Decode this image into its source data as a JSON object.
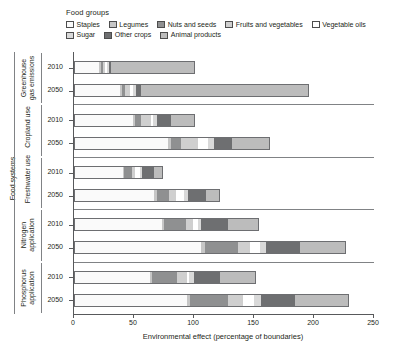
{
  "legend": {
    "title": "Food groups",
    "rows": [
      [
        {
          "label": "Staples",
          "color": "#fafafa",
          "key": "staples"
        },
        {
          "label": "Legumes",
          "color": "#c6c6c6",
          "key": "legumes"
        },
        {
          "label": "Nuts and seeds",
          "color": "#8f9091",
          "key": "nuts_and_seeds"
        },
        {
          "label": "Fruits and vegetables",
          "color": "#cfcfcf",
          "key": "fruits_and_vegetables"
        },
        {
          "label": "Vegetable oils",
          "color": "#ffffff",
          "key": "vegetable_oils"
        }
      ],
      [
        {
          "label": "Sugar",
          "color": "#d9d9d9",
          "key": "sugar"
        },
        {
          "label": "Other crops",
          "color": "#6e6f71",
          "key": "other_crops"
        },
        {
          "label": "Animal products",
          "color": "#bcbcbc",
          "key": "animal_products"
        }
      ]
    ]
  },
  "axis_outer_label": "Food systems",
  "chart_data": {
    "type": "bar",
    "orientation": "horizontal",
    "stacked": true,
    "title": "",
    "xlabel": "Environmental effect (percentage of boundaries)",
    "ylabel": "Food systems",
    "xlim": [
      0,
      250
    ],
    "xticks": [
      0,
      50,
      100,
      150,
      200,
      250
    ],
    "grid": false,
    "legend_position": "top",
    "series": [
      {
        "name": "Staples",
        "color": "#fafafa"
      },
      {
        "name": "Legumes",
        "color": "#c6c6c6"
      },
      {
        "name": "Nuts and seeds",
        "color": "#8f9091"
      },
      {
        "name": "Fruits and vegetables",
        "color": "#cfcfcf"
      },
      {
        "name": "Vegetable oils",
        "color": "#ffffff"
      },
      {
        "name": "Sugar",
        "color": "#d9d9d9"
      },
      {
        "name": "Other crops",
        "color": "#6e6f71"
      },
      {
        "name": "Animal products",
        "color": "#bcbcbc"
      }
    ],
    "groups": [
      {
        "name": "Greenhouse gas emissions",
        "bars": [
          {
            "category": "2010",
            "total": 101,
            "segments": [
              {
                "series": "Staples",
                "value": 21
              },
              {
                "series": "Legumes",
                "value": 1.5
              },
              {
                "series": "Nuts and seeds",
                "value": 1.5
              },
              {
                "series": "Fruits and vegetables",
                "value": 2
              },
              {
                "series": "Vegetable oils",
                "value": 1.5
              },
              {
                "series": "Sugar",
                "value": 1.5
              },
              {
                "series": "Other crops",
                "value": 2
              },
              {
                "series": "Animal products",
                "value": 70
              }
            ]
          },
          {
            "category": "2050",
            "total": 196,
            "segments": [
              {
                "series": "Staples",
                "value": 38
              },
              {
                "series": "Legumes",
                "value": 2
              },
              {
                "series": "Nuts and seeds",
                "value": 2.5
              },
              {
                "series": "Fruits and vegetables",
                "value": 4
              },
              {
                "series": "Vegetable oils",
                "value": 3
              },
              {
                "series": "Sugar",
                "value": 2.5
              },
              {
                "series": "Other crops",
                "value": 4
              },
              {
                "series": "Animal products",
                "value": 140
              }
            ]
          }
        ]
      },
      {
        "name": "Cropland use",
        "bars": [
          {
            "category": "2010",
            "total": 101,
            "segments": [
              {
                "series": "Staples",
                "value": 49
              },
              {
                "series": "Legumes",
                "value": 2
              },
              {
                "series": "Nuts and seeds",
                "value": 5
              },
              {
                "series": "Fruits and vegetables",
                "value": 8
              },
              {
                "series": "Vegetable oils",
                "value": 1.5
              },
              {
                "series": "Sugar",
                "value": 4
              },
              {
                "series": "Other crops",
                "value": 11
              },
              {
                "series": "Animal products",
                "value": 20.5
              }
            ]
          },
          {
            "category": "2050",
            "total": 163,
            "segments": [
              {
                "series": "Staples",
                "value": 78
              },
              {
                "series": "Legumes",
                "value": 3
              },
              {
                "series": "Nuts and seeds",
                "value": 8
              },
              {
                "series": "Fruits and vegetables",
                "value": 14
              },
              {
                "series": "Vegetable oils",
                "value": 9
              },
              {
                "series": "Sugar",
                "value": 5
              },
              {
                "series": "Other crops",
                "value": 15
              },
              {
                "series": "Animal products",
                "value": 31
              }
            ]
          }
        ]
      },
      {
        "name": "Freshwater use",
        "bars": [
          {
            "category": "2010",
            "total": 74,
            "segments": [
              {
                "series": "Staples",
                "value": 41
              },
              {
                "series": "Legumes",
                "value": 1
              },
              {
                "series": "Nuts and seeds",
                "value": 6
              },
              {
                "series": "Fruits and vegetables",
                "value": 3
              },
              {
                "series": "Vegetable oils",
                "value": 4
              },
              {
                "series": "Sugar",
                "value": 2
              },
              {
                "series": "Other crops",
                "value": 10
              },
              {
                "series": "Animal products",
                "value": 7
              }
            ]
          },
          {
            "category": "2050",
            "total": 122,
            "segments": [
              {
                "series": "Staples",
                "value": 67
              },
              {
                "series": "Legumes",
                "value": 2
              },
              {
                "series": "Nuts and seeds",
                "value": 10
              },
              {
                "series": "Fruits and vegetables",
                "value": 6
              },
              {
                "series": "Vegetable oils",
                "value": 7
              },
              {
                "series": "Sugar",
                "value": 3
              },
              {
                "series": "Other crops",
                "value": 15
              },
              {
                "series": "Animal products",
                "value": 12
              }
            ]
          }
        ]
      },
      {
        "name": "Nitrogen application",
        "bars": [
          {
            "category": "2010",
            "total": 154,
            "segments": [
              {
                "series": "Staples",
                "value": 73
              },
              {
                "series": "Legumes",
                "value": 2
              },
              {
                "series": "Nuts and seeds",
                "value": 18
              },
              {
                "series": "Fruits and vegetables",
                "value": 6
              },
              {
                "series": "Vegetable oils",
                "value": 4
              },
              {
                "series": "Sugar",
                "value": 3
              },
              {
                "series": "Other crops",
                "value": 22
              },
              {
                "series": "Animal products",
                "value": 26
              }
            ]
          },
          {
            "category": "2050",
            "total": 227,
            "segments": [
              {
                "series": "Staples",
                "value": 106
              },
              {
                "series": "Legumes",
                "value": 3
              },
              {
                "series": "Nuts and seeds",
                "value": 28
              },
              {
                "series": "Fruits and vegetables",
                "value": 10
              },
              {
                "series": "Vegetable oils",
                "value": 8
              },
              {
                "series": "Sugar",
                "value": 5
              },
              {
                "series": "Other crops",
                "value": 28
              },
              {
                "series": "Animal products",
                "value": 39
              }
            ]
          }
        ]
      },
      {
        "name": "Phosphorus application",
        "bars": [
          {
            "category": "2010",
            "total": 152,
            "segments": [
              {
                "series": "Staples",
                "value": 63
              },
              {
                "series": "Legumes",
                "value": 2
              },
              {
                "series": "Nuts and seeds",
                "value": 21
              },
              {
                "series": "Fruits and vegetables",
                "value": 8
              },
              {
                "series": "Vegetable oils",
                "value": 2
              },
              {
                "series": "Sugar",
                "value": 4
              },
              {
                "series": "Other crops",
                "value": 22
              },
              {
                "series": "Animal products",
                "value": 30
              }
            ]
          },
          {
            "category": "2050",
            "total": 229,
            "segments": [
              {
                "series": "Staples",
                "value": 94
              },
              {
                "series": "Legumes",
                "value": 3
              },
              {
                "series": "Nuts and seeds",
                "value": 31
              },
              {
                "series": "Fruits and vegetables",
                "value": 13
              },
              {
                "series": "Vegetable oils",
                "value": 9
              },
              {
                "series": "Sugar",
                "value": 6
              },
              {
                "series": "Other crops",
                "value": 28
              },
              {
                "series": "Animal products",
                "value": 45
              }
            ]
          }
        ]
      }
    ]
  }
}
